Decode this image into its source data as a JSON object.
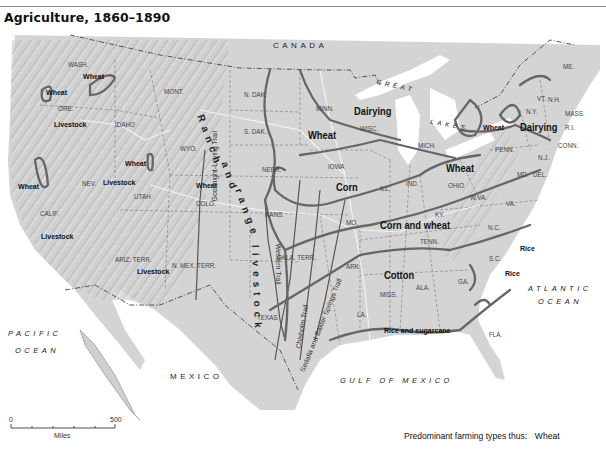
{
  "title": "Agriculture, 1860–1890",
  "countries": {
    "canada": "CANADA",
    "mexico": "MEXICO"
  },
  "water": {
    "pacific_1": "PACIFIC",
    "pacific_2": "OCEAN",
    "atlantic_1": "ATLANTIC",
    "atlantic_2": "OCEAN",
    "gulf": "GULF OF MEXICO",
    "great": "GREAT",
    "lakes": "LAKES"
  },
  "states": {
    "wash": "WASH.",
    "ore": "ORE.",
    "idaho": "IDAHO",
    "mont": "MONT.",
    "wyo": "WYO.",
    "nev": "NEV.",
    "utah": "UTAH",
    "calif": "CALIF.",
    "colo": "COLO.",
    "ariz": "ARIZ. TERR.",
    "nmex": "N. MEX. TERR.",
    "ndak": "N. DAK.",
    "sdak": "S. DAK.",
    "nebr": "NEBR.",
    "kans": "KANS.",
    "okla": "OKLA. TERR.",
    "texas": "TEXAS",
    "minn": "MINN.",
    "iowa": "IOWA",
    "mo": "MO.",
    "ark": "ARK.",
    "la": "LA.",
    "wisc": "WISC.",
    "ill": "ILL.",
    "mich": "MICH.",
    "ind": "IND.",
    "ohio": "OHIO",
    "ky": "KY.",
    "tenn": "TENN.",
    "miss": "MISS.",
    "ala": "ALA.",
    "ga": "GA.",
    "fla": "FLA.",
    "sc": "S.C.",
    "nc": "N.C.",
    "va": "VA.",
    "wva": "W.VA.",
    "md": "MD.",
    "del": "DEL.",
    "nj": "N.J.",
    "penn": "PENN.",
    "ny": "N.Y.",
    "vt": "VT.",
    "nh": "N.H.",
    "me": "ME.",
    "mass": "MASS.",
    "ri": "R.I.",
    "conn": "CONN."
  },
  "farming_regions": {
    "wheat_wash": "Wheat",
    "wheat_ore": "Wheat",
    "livestock_ore": "Livestock",
    "wheat_calif": "Wheat",
    "livestock_calif": "Livestock",
    "livestock_nev": "Livestock",
    "wheat_utah": "Wheat",
    "wheat_colo": "Wheat",
    "livestock_ariz": "Livestock",
    "ranch_1": "Ranch",
    "ranch_2": "and",
    "ranch_3": "range",
    "ranch_4": "livestock",
    "wheat_plains": "Wheat",
    "dairying_wisc": "Dairying",
    "corn": "Corn",
    "wheat_ohio": "Wheat",
    "wheat_ny": "Wheat",
    "dairying_ne": "Dairying",
    "corn_and_wheat": "Corn and wheat",
    "cotton": "Cotton",
    "rice_sugarcane": "Rice and sugarcane",
    "rice_1": "Rice",
    "rice_2": "Rice"
  },
  "trails": {
    "goodnight": "Goodnight-Loving Trail",
    "western": "Western Trail",
    "chisholm": "Chisholm Trail",
    "sedalia": "Sedalia and Baxter Springs Trail"
  },
  "scale": {
    "start": "0",
    "end": "500",
    "unit": "Miles"
  },
  "legend": {
    "label": "Predominant farming types thus:",
    "example": "Wheat"
  }
}
